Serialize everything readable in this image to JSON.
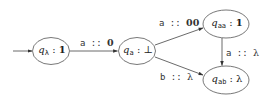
{
  "diagram": {
    "type": "automaton",
    "initial_state": "q_lambda",
    "nodes": [
      {
        "id": "q_lambda",
        "name": "q",
        "subscript": "λ",
        "sep": " : ",
        "output": "1",
        "output_bold": true
      },
      {
        "id": "q_a",
        "name": "q",
        "subscript": "a",
        "sep": " : ",
        "output": "⊥",
        "output_bold": false
      },
      {
        "id": "q_aa",
        "name": "q",
        "subscript": "aa",
        "sep": " : ",
        "output": "1",
        "output_bold": true
      },
      {
        "id": "q_ab",
        "name": "q",
        "subscript": "ab",
        "sep": " : ",
        "output": "λ",
        "output_bold": false
      }
    ],
    "edges": [
      {
        "from": "q_lambda",
        "to": "q_a",
        "symbol": "a",
        "sep": " :: ",
        "output": "0",
        "output_bold": true
      },
      {
        "from": "q_a",
        "to": "q_aa",
        "symbol": "a",
        "sep": " :: ",
        "output": "00",
        "output_bold": true
      },
      {
        "from": "q_a",
        "to": "q_ab",
        "symbol": "b",
        "sep": " :: ",
        "output": "λ",
        "output_bold": false
      },
      {
        "from": "q_aa",
        "to": "q_ab",
        "symbol": "a",
        "sep": " :: ",
        "output": "λ",
        "output_bold": false
      }
    ],
    "colors": {
      "stroke": "#444444",
      "text": "#222222"
    }
  }
}
